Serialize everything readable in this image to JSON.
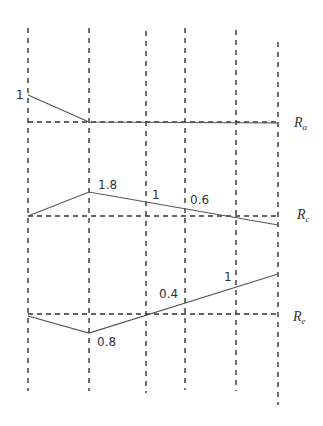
{
  "diagram": {
    "type": "influence-line-diagram",
    "vertical_guides_x": [
      28,
      89,
      146,
      185,
      236,
      278
    ],
    "colors": {
      "line": "#555555",
      "dash": "#333333",
      "text": "#333333"
    },
    "panels": [
      {
        "id": "Ra",
        "label_main": "R",
        "label_sub": "a",
        "baseline_y": 122,
        "points": [
          [
            28,
            95
          ],
          [
            89,
            122
          ],
          [
            278,
            122
          ]
        ],
        "value_labels": [
          {
            "text": "1",
            "x": 16,
            "y": 99
          }
        ]
      },
      {
        "id": "Rc",
        "label_main": "R",
        "label_sub": "c",
        "baseline_y": 216,
        "points": [
          [
            28,
            216
          ],
          [
            89,
            192
          ],
          [
            278,
            225
          ]
        ],
        "value_labels": [
          {
            "text": "1.8",
            "x": 98,
            "y": 189
          },
          {
            "text": "1",
            "x": 152,
            "y": 199
          },
          {
            "text": "0.6",
            "x": 190,
            "y": 204
          }
        ]
      },
      {
        "id": "Re",
        "label_main": "R",
        "label_sub": "e",
        "baseline_y": 314,
        "points": [
          [
            28,
            316
          ],
          [
            89,
            333
          ],
          [
            278,
            274
          ]
        ],
        "value_labels": [
          {
            "text": "0.8",
            "x": 97,
            "y": 346
          },
          {
            "text": "0.4",
            "x": 159,
            "y": 298
          },
          {
            "text": "1",
            "x": 224,
            "y": 281
          }
        ]
      }
    ]
  }
}
